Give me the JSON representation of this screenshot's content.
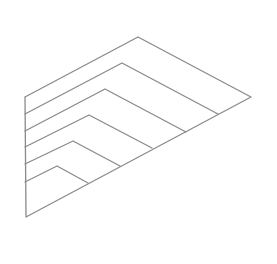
{
  "figure": {
    "width": 277,
    "height": 264,
    "background": "#ffffff",
    "line_color": "#8a8a8a",
    "outline": {
      "points": [
        [
          25,
          97
        ],
        [
          138,
          37
        ],
        [
          251,
          97
        ],
        [
          26,
          217
        ],
        [
          25,
          97
        ]
      ]
    },
    "nested_chevrons": [
      {
        "left": [
          25,
          114
        ],
        "apex": [
          122,
          63
        ],
        "right": [
          218,
          114
        ]
      },
      {
        "left": [
          25,
          131
        ],
        "apex": [
          105,
          89
        ],
        "right": [
          186,
          132
        ]
      },
      {
        "left": [
          25,
          147
        ],
        "apex": [
          89,
          115
        ],
        "right": [
          152,
          148
        ]
      },
      {
        "left": [
          25,
          164
        ],
        "apex": [
          73,
          141
        ],
        "right": [
          120,
          166
        ]
      },
      {
        "left": [
          25,
          182
        ],
        "apex": [
          57,
          166
        ],
        "right": [
          88,
          183
        ]
      }
    ]
  }
}
